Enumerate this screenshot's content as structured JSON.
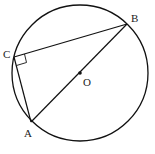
{
  "diagram": {
    "type": "geometry",
    "circle": {
      "center_label": "O",
      "cx": 80,
      "cy": 73,
      "r": 68
    },
    "points": [
      {
        "label": "A",
        "x": 31,
        "y": 122
      },
      {
        "label": "B",
        "x": 127,
        "y": 24
      },
      {
        "label": "C",
        "x": 14,
        "y": 57
      },
      {
        "label": "O",
        "x": 80,
        "y": 73
      }
    ],
    "segments": [
      "AB",
      "BC",
      "CA"
    ],
    "right_angle_at": "C",
    "labels": {
      "A": "A",
      "B": "B",
      "C": "C",
      "O": "O"
    }
  }
}
